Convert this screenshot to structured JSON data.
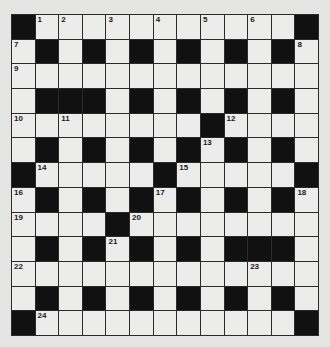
{
  "puzzle": {
    "rows": 13,
    "cols": 13,
    "colors": {
      "black": "#111111",
      "white": "#ececea",
      "background": "#e4e4e2"
    },
    "layout": [
      "#............#",
      ".#.#.#.#.#.#.",
      ".............",
      ".###.#.#.#.#.",
      "........#....",
      ".#.#.#.#.#.#.",
      "#.....#.....#",
      ".#.#.#.#.#.#.",
      "....#........",
      ".#.#.#.#.###.",
      ".............",
      ".#.#.#.#.#.#.",
      "#...........#"
    ],
    "grid": [
      [
        "#",
        "1",
        "2",
        ".",
        "3",
        ".",
        "4",
        ".",
        "5",
        ".",
        "6",
        ".",
        "#"
      ],
      [
        "7",
        "#",
        ".",
        "#",
        ".",
        "#",
        ".",
        "#",
        ".",
        "#",
        ".",
        "#",
        "8"
      ],
      [
        "9",
        ".",
        ".",
        ".",
        ".",
        ".",
        ".",
        ".",
        ".",
        ".",
        ".",
        ".",
        "."
      ],
      [
        ".",
        "#",
        "#",
        "#",
        ".",
        "#",
        ".",
        "#",
        ".",
        "#",
        ".",
        "#",
        "."
      ],
      [
        "10",
        ".",
        "11",
        ".",
        ".",
        ".",
        ".",
        ".",
        "#",
        "12",
        ".",
        ".",
        "."
      ],
      [
        ".",
        "#",
        ".",
        "#",
        ".",
        "#",
        ".",
        "#",
        "13",
        "#",
        ".",
        "#",
        "."
      ],
      [
        "#",
        "14",
        ".",
        ".",
        ".",
        ".",
        "#",
        "15",
        ".",
        ".",
        ".",
        ".",
        "#"
      ],
      [
        "16",
        "#",
        ".",
        "#",
        ".",
        "#",
        "17",
        "#",
        ".",
        "#",
        ".",
        "#",
        "18"
      ],
      [
        "19",
        ".",
        ".",
        ".",
        "#",
        "20",
        ".",
        ".",
        ".",
        ".",
        ".",
        ".",
        "."
      ],
      [
        ".",
        "#",
        ".",
        "#",
        "21",
        "#",
        ".",
        "#",
        ".",
        "#",
        "#",
        "#",
        "."
      ],
      [
        "22",
        ".",
        ".",
        ".",
        ".",
        ".",
        ".",
        ".",
        ".",
        ".",
        "23",
        ".",
        "."
      ],
      [
        ".",
        "#",
        ".",
        "#",
        ".",
        "#",
        ".",
        "#",
        ".",
        "#",
        ".",
        "#",
        "."
      ],
      [
        "#",
        "24",
        ".",
        ".",
        ".",
        ".",
        ".",
        ".",
        ".",
        ".",
        ".",
        ".",
        "#"
      ]
    ],
    "clue_numbers": [
      1,
      2,
      3,
      4,
      5,
      6,
      7,
      8,
      9,
      10,
      11,
      12,
      13,
      14,
      15,
      16,
      17,
      18,
      19,
      20,
      21,
      22,
      23,
      24
    ]
  }
}
